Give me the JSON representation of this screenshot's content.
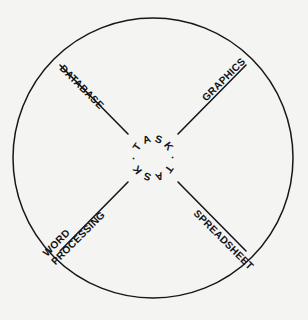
{
  "figure": {
    "shape": "circle",
    "background_color": "#f4f4f3",
    "line_color": "#17171a",
    "text_color": "#111115"
  },
  "center": {
    "ring_text": "TASK · TASK ·",
    "words": [
      "TASK",
      "TASK"
    ],
    "separator": "·",
    "letters": [
      "T",
      "A",
      "S",
      "K",
      "·",
      "T",
      "A",
      "S",
      "K",
      "·"
    ]
  },
  "spokes": [
    {
      "id": "database",
      "label": "DATABASE",
      "label_lines": [
        "DATABASE"
      ],
      "position": "upper-left",
      "angle_deg": 135
    },
    {
      "id": "graphics",
      "label": "GRAPHICS",
      "label_lines": [
        "GRAPHICS"
      ],
      "position": "upper-right",
      "angle_deg": 45
    },
    {
      "id": "spreadsheet",
      "label": "SPREADSHEET",
      "label_lines": [
        "SPREADSHEET"
      ],
      "position": "lower-right",
      "angle_deg": 315
    },
    {
      "id": "word-processing",
      "label": "WORD PROCESSING",
      "label_lines": [
        "WORD",
        "PROCESSING"
      ],
      "position": "lower-left",
      "angle_deg": 225
    }
  ],
  "chart_data": {
    "type": "diagram",
    "title": "",
    "categories": [
      "DATABASE",
      "GRAPHICS",
      "SPREADSHEET",
      "WORD PROCESSING"
    ],
    "center_label": "TASK",
    "center_repeat": 2,
    "legend": []
  }
}
